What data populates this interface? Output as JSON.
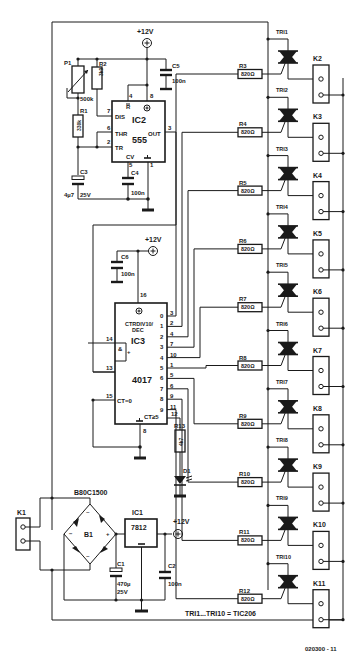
{
  "figure_id": "020300 - 11",
  "note": "TRI1...TRI10 = TIC206",
  "supply": {
    "label": "+12V"
  },
  "ic2": {
    "name": "IC2",
    "type": "555",
    "pins": {
      "dis": "DIS",
      "thr": "THR",
      "tr": "TR",
      "out": "OUT",
      "cv": "CV",
      "r": "R"
    },
    "pin_numbers": {
      "dis": "7",
      "thr": "6",
      "tr": "2",
      "out": "3",
      "cv": "5",
      "gnd": "1",
      "r": "4",
      "vcc": "8"
    }
  },
  "ic3": {
    "name": "IC3",
    "type": "4017",
    "func": "CTRDIV10/",
    "func2": "DEC",
    "and": "&",
    "plus": "+",
    "ct0": "CT=0",
    "ct5": "CT≥5",
    "in_pins": {
      "a": "14",
      "b": "13",
      "c": "15",
      "vcc": "16",
      "gnd": "8",
      "co": "12"
    },
    "outputs": [
      {
        "q": "0",
        "pin": "3"
      },
      {
        "q": "1",
        "pin": "2"
      },
      {
        "q": "2",
        "pin": "4"
      },
      {
        "q": "3",
        "pin": "7"
      },
      {
        "q": "4",
        "pin": "10"
      },
      {
        "q": "5",
        "pin": "1"
      },
      {
        "q": "6",
        "pin": "5"
      },
      {
        "q": "7",
        "pin": "6"
      },
      {
        "q": "8",
        "pin": "9"
      },
      {
        "q": "9",
        "pin": "11"
      }
    ]
  },
  "ic1": {
    "name": "IC1",
    "type": "7812"
  },
  "bridge": {
    "name": "B1",
    "type": "B80C1500",
    "plus": "+",
    "minus": "−",
    "ac": "~"
  },
  "components": {
    "p1": {
      "name": "P1",
      "value": "500k"
    },
    "r1": {
      "name": "R1",
      "value": "330k"
    },
    "r2": {
      "name": "R2",
      "value": "3k9"
    },
    "r13": {
      "name": "R13",
      "value": "4k7"
    },
    "c1": {
      "name": "C1",
      "value": "470µ",
      "volt": "25V"
    },
    "c2": {
      "name": "C2",
      "value": "100n"
    },
    "c3": {
      "name": "C3",
      "value": "4µ7",
      "volt": "25V"
    },
    "c4": {
      "name": "C4",
      "value": "100n"
    },
    "c5": {
      "name": "C5",
      "value": "100n"
    },
    "c6": {
      "name": "C6",
      "value": "100n"
    },
    "d1": {
      "name": "D1"
    },
    "k1": {
      "name": "K1"
    }
  },
  "channels": [
    {
      "triac": "TRI1",
      "resistor": "R3",
      "value": "820Ω",
      "connector": "K2"
    },
    {
      "triac": "TRI2",
      "resistor": "R4",
      "value": "820Ω",
      "connector": "K3"
    },
    {
      "triac": "TRI3",
      "resistor": "R5",
      "value": "820Ω",
      "connector": "K4"
    },
    {
      "triac": "TRI4",
      "resistor": "R6",
      "value": "820Ω",
      "connector": "K5"
    },
    {
      "triac": "TRI5",
      "resistor": "R7",
      "value": "820Ω",
      "connector": "K6"
    },
    {
      "triac": "TRI6",
      "resistor": "R8",
      "value": "820Ω",
      "connector": "K7"
    },
    {
      "triac": "TRI7",
      "resistor": "R9",
      "value": "820Ω",
      "connector": "K8"
    },
    {
      "triac": "TRI8",
      "resistor": "R10",
      "value": "820Ω",
      "connector": "K9"
    },
    {
      "triac": "TRI9",
      "resistor": "R11",
      "value": "820Ω",
      "connector": "K10"
    },
    {
      "triac": "TRI10",
      "resistor": "R12",
      "value": "820Ω",
      "connector": "K11"
    }
  ]
}
